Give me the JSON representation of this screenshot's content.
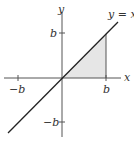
{
  "diagram": {
    "axes": {
      "x_label": "x",
      "y_label": "y"
    },
    "ticks": {
      "x_pos": "b",
      "x_neg": "−b",
      "y_pos": "b",
      "y_neg": "−b"
    },
    "line_label": "y = x",
    "shaded_region": "triangle bounded by y = x, x-axis, and x = b",
    "colors": {
      "axis": "#555555",
      "line": "#222222",
      "fill": "#e6e6e6"
    }
  }
}
